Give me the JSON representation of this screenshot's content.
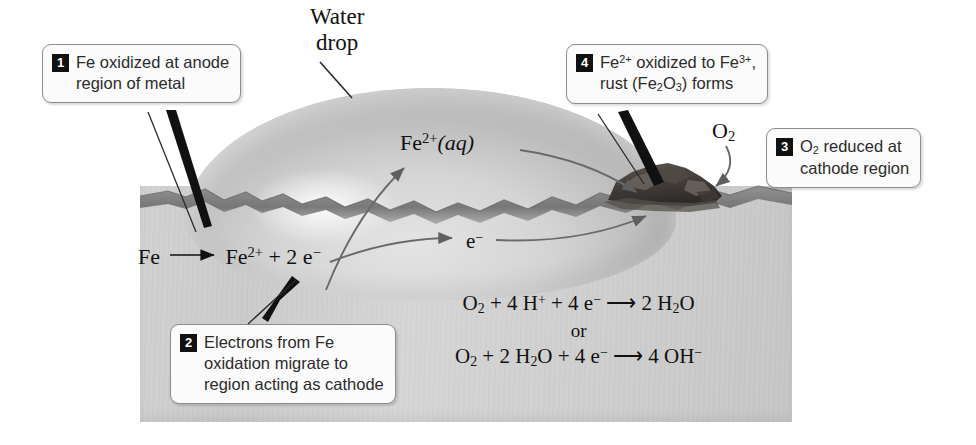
{
  "diagram": {
    "water_drop_label_line1": "Water",
    "water_drop_label_line2": "drop"
  },
  "labels": {
    "fe2_aq": "Fe2+(aq)",
    "fe2_aq_parts": {
      "base": "Fe",
      "charge": "2+",
      "state": "(aq)"
    },
    "o2": "O2",
    "o2_parts": {
      "base": "O",
      "sub": "2"
    },
    "electron": "e-",
    "electron_parts": {
      "base": "e",
      "sup": "−"
    }
  },
  "equations": {
    "anode": {
      "left": "Fe",
      "arrow": "⟶",
      "right_parts": [
        {
          "base": "Fe",
          "sup": "2+"
        },
        {
          "plain": " + 2 e",
          "sup": "−"
        }
      ],
      "text": "Fe ⟶ Fe2+ + 2 e−"
    },
    "cathode_1": {
      "text": "O2 + 4 H+ + 4 e− ⟶ 2 H2O"
    },
    "or": "or",
    "cathode_2": {
      "text": "O2 + 2 H2O + 4 e− ⟶ 4 OH−"
    }
  },
  "callouts": [
    {
      "number": "1",
      "lines": [
        "Fe oxidized at anode",
        "region of metal"
      ],
      "id": "callout1"
    },
    {
      "number": "2",
      "lines": [
        "Electrons from Fe",
        "oxidation migrate to",
        "region acting as cathode"
      ],
      "id": "callout2"
    },
    {
      "number": "3",
      "lines": [
        "O2 reduced at",
        "cathode region"
      ],
      "id": "callout3"
    },
    {
      "number": "4",
      "lines": [
        "Fe2+ oxidized to Fe3+,",
        "rust (Fe2O3) forms"
      ],
      "id": "callout4"
    }
  ],
  "colors": {
    "metal": "#cfcfcf",
    "water_drop": "#cccccc",
    "rust": "#4a4440",
    "callout_border": "#8c8c8c",
    "badge_bg": "#111111",
    "arrow": "#5a5a5a",
    "text": "#1a1a1a"
  }
}
